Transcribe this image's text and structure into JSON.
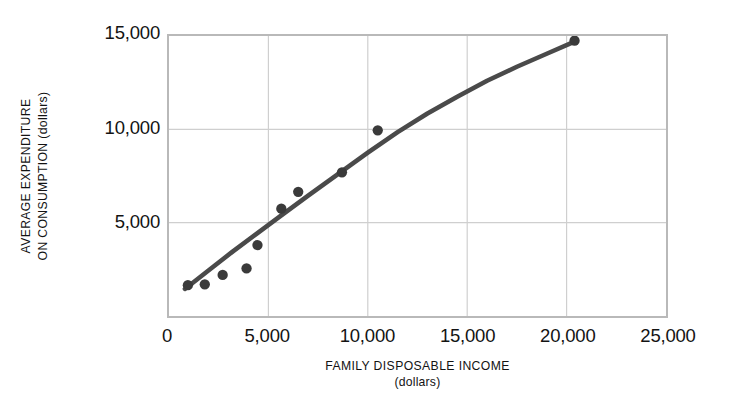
{
  "chart_data": {
    "type": "scatter",
    "title": "",
    "xlabel": "FAMILY DISPOSABLE INCOME",
    "xlabel_line2": "(dollars)",
    "ylabel_line1": "AVERAGE EXPENDITURE",
    "ylabel_line2": "ON CONSUMPTION (dollars)",
    "xlim": [
      0,
      25000
    ],
    "ylim": [
      0,
      15000
    ],
    "xticks": [
      0,
      5000,
      10000,
      15000,
      20000,
      25000
    ],
    "xtick_labels": [
      "0",
      "5,000",
      "10,000",
      "15,000",
      "20,000",
      "25,000"
    ],
    "yticks": [
      5000,
      10000,
      15000
    ],
    "ytick_labels": [
      "5,000",
      "10,000",
      "15,000"
    ],
    "grid": true,
    "grid_color": "#cfcfcf",
    "frame_color": "#b9b9b9",
    "marker_color": "#3a3a3a",
    "line_color": "#4a4a4a",
    "marker_radius": 5.2,
    "line_width": 4.6,
    "legend": null,
    "series": [
      {
        "name": "observations",
        "type": "scatter",
        "points": [
          {
            "x": 950,
            "y": 1650
          },
          {
            "x": 1800,
            "y": 1700
          },
          {
            "x": 2700,
            "y": 2200
          },
          {
            "x": 3900,
            "y": 2550
          },
          {
            "x": 4450,
            "y": 3800
          },
          {
            "x": 5650,
            "y": 5750
          },
          {
            "x": 6500,
            "y": 6650
          },
          {
            "x": 8700,
            "y": 7700
          },
          {
            "x": 10500,
            "y": 9950
          },
          {
            "x": 20400,
            "y": 14750
          }
        ]
      },
      {
        "name": "fitted-consumption-curve",
        "type": "line",
        "points": [
          {
            "x": 800,
            "y": 1450
          },
          {
            "x": 2000,
            "y": 2450
          },
          {
            "x": 3200,
            "y": 3450
          },
          {
            "x": 4400,
            "y": 4400
          },
          {
            "x": 5600,
            "y": 5350
          },
          {
            "x": 7000,
            "y": 6450
          },
          {
            "x": 8500,
            "y": 7600
          },
          {
            "x": 10000,
            "y": 8750
          },
          {
            "x": 11500,
            "y": 9850
          },
          {
            "x": 13000,
            "y": 10850
          },
          {
            "x": 14500,
            "y": 11750
          },
          {
            "x": 16000,
            "y": 12600
          },
          {
            "x": 17500,
            "y": 13350
          },
          {
            "x": 19000,
            "y": 14050
          },
          {
            "x": 20400,
            "y": 14700
          }
        ]
      }
    ]
  }
}
